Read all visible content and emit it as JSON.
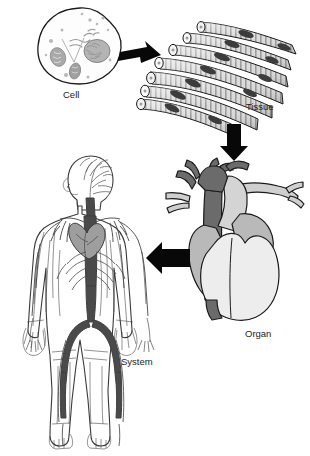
{
  "figure": {
    "background_color": "#ffffff",
    "ink_color": "#1b1b1b"
  },
  "stages": [
    {
      "id": "cell",
      "label": "Cell",
      "caption_x": 63,
      "caption_y": 88,
      "description": "Irregular rounded cell with nucleus, mitochondria, endoplasmic reticulum and granules",
      "outline_color": "#1b1b1b",
      "fill_color": "#fdfdfd",
      "organelle_color": "#a8a8a8"
    },
    {
      "id": "tissue",
      "label": "Tissue",
      "caption_x": 246,
      "caption_y": 100,
      "description": "Bundle of striated skeletal muscle fibers with dark nuclei and cut circular ends",
      "outline_color": "#1b1b1b",
      "fill_color": "#d9d9d9",
      "stripe_color": "#8d8d8d",
      "nucleus_color": "#3c3c3c"
    },
    {
      "id": "organ",
      "label": "Organ",
      "caption_x": 245,
      "caption_y": 327,
      "description": "Human heart with great vessels, atria and ventricles",
      "outline_color": "#1b1b1b",
      "vessel_dark_color": "#6b6b6b",
      "atrium_color": "#b9b9b9",
      "ventricle_color": "#ededed",
      "vessel_light_color": "#cfcfcf"
    },
    {
      "id": "system",
      "label": "System",
      "caption_x": 121,
      "caption_y": 355,
      "description": "Full human body showing the circulatory system: heart, aorta, arteries and veins",
      "outline_color": "#3a3a3a",
      "body_fill_color": "#ffffff",
      "vessel_color": "#4a4a4a",
      "heart_color": "#9e9e9e"
    }
  ],
  "arrows": [
    {
      "id": "arrow-cell-to-tissue",
      "direction": "right",
      "from": "cell",
      "to": "tissue",
      "color": "#080808"
    },
    {
      "id": "arrow-tissue-to-organ",
      "direction": "down",
      "from": "tissue",
      "to": "organ",
      "color": "#080808"
    },
    {
      "id": "arrow-organ-to-system",
      "direction": "left",
      "from": "organ",
      "to": "system",
      "color": "#080808"
    }
  ]
}
